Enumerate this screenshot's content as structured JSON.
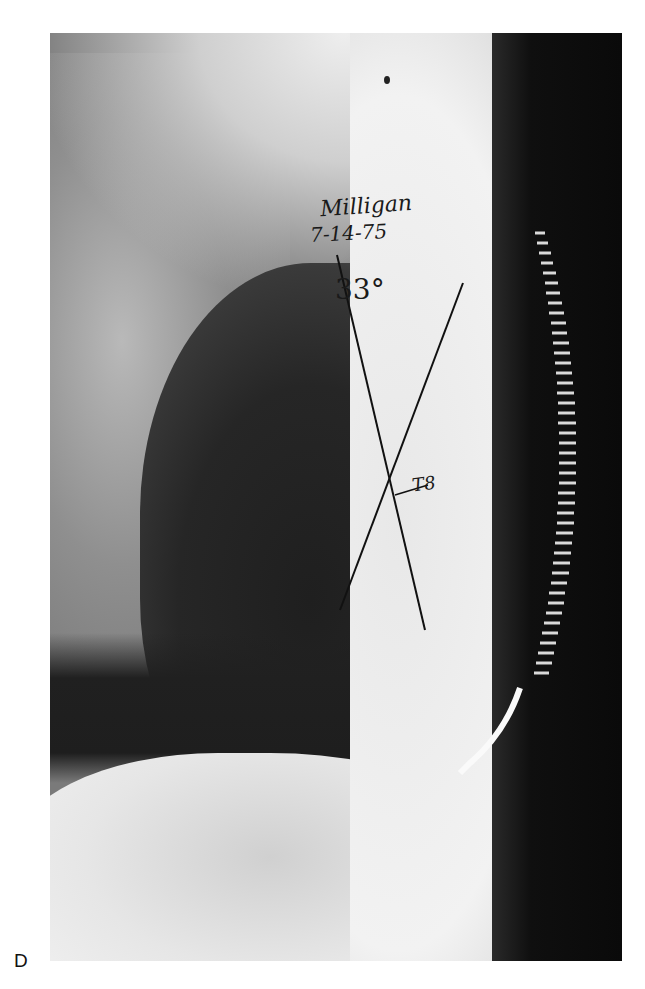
{
  "figure": {
    "panel_label": "D",
    "view": "lateral radiograph",
    "annotations": {
      "name": "Milligan",
      "date": "7-14-75",
      "angle": "33°",
      "vertebral_level": "T8"
    },
    "colors": {
      "film_dark": "#1e1e1e",
      "film_light": "#f2f2f2",
      "background_dark": "#0a0a0a",
      "ink": "#1a1a1a"
    }
  }
}
